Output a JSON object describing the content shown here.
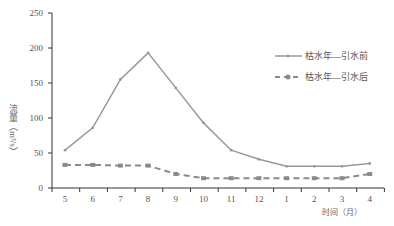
{
  "chart_data": {
    "type": "line",
    "title": "",
    "xlabel": "时间（月）",
    "ylabel": "流量（m³/s）",
    "ylim": [
      0,
      250
    ],
    "yticks": [
      0,
      50,
      100,
      150,
      200,
      250
    ],
    "categories": [
      "5",
      "6",
      "7",
      "8",
      "9",
      "10",
      "11",
      "12",
      "1",
      "2",
      "3",
      "4"
    ],
    "series": [
      {
        "name": "枯水年—引水前",
        "style": "solid",
        "color": "#999999",
        "values": [
          54,
          86,
          155,
          193,
          143,
          93,
          54,
          41,
          31,
          31,
          31,
          35
        ]
      },
      {
        "name": "枯水年—引水后",
        "style": "dashed",
        "color": "#8a8a8a",
        "values": [
          33,
          33,
          32,
          32,
          20,
          14,
          14,
          14,
          14,
          14,
          14,
          20
        ]
      }
    ],
    "legend_position": "right-upper",
    "grid": false
  }
}
